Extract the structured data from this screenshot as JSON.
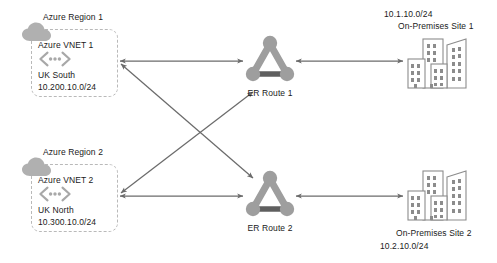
{
  "diagram": {
    "colors": {
      "arrow": "#6b6b6b",
      "node_fill": "#9e9e9e",
      "node_dark": "#5a5a5a",
      "cloud": "#b0b0b0",
      "box_border": "#b9b9b9",
      "text": "#1a1a1a",
      "building_stroke": "#8c8c8c"
    },
    "regions": [
      {
        "id": "region-1",
        "title": "Azure Region 1",
        "vnet_name": "Azure VNET 1",
        "vnet_icon": "vnet-icon",
        "cloud_icon": "cloud-icon",
        "location": "UK South",
        "cidr": "10.200.10.0/24"
      },
      {
        "id": "region-2",
        "title": "Azure Region 2",
        "vnet_name": "Azure VNET 2",
        "vnet_icon": "vnet-icon",
        "cloud_icon": "cloud-icon",
        "location": "UK North",
        "cidr": "10.300.10.0/24"
      }
    ],
    "routes": [
      {
        "id": "er-route-1",
        "label": "ER Route 1",
        "icon": "expressroute-icon"
      },
      {
        "id": "er-route-2",
        "label": "ER Route 2",
        "icon": "expressroute-icon"
      }
    ],
    "sites": [
      {
        "id": "site-1",
        "name": "On-Premises Site 1",
        "cidr": "10.1.10.0/24",
        "icon": "buildings-icon",
        "label_position": "above"
      },
      {
        "id": "site-2",
        "name": "On-Premises Site 2",
        "cidr": "10.2.10.0/24",
        "icon": "buildings-icon",
        "label_position": "below"
      }
    ],
    "connections": [
      {
        "id": "vnet1-er1",
        "from": "Azure VNET 1",
        "to": "ER Route 1",
        "style": "double-arrow"
      },
      {
        "id": "vnet1-er2",
        "from": "Azure VNET 1",
        "to": "ER Route 2",
        "style": "double-arrow"
      },
      {
        "id": "vnet2-er1",
        "from": "Azure VNET 2",
        "to": "ER Route 1",
        "style": "double-arrow"
      },
      {
        "id": "vnet2-er2",
        "from": "Azure VNET 2",
        "to": "ER Route 2",
        "style": "double-arrow"
      },
      {
        "id": "er1-site1",
        "from": "ER Route 1",
        "to": "On-Premises Site 1",
        "style": "double-arrow"
      },
      {
        "id": "er2-site2",
        "from": "ER Route 2",
        "to": "On-Premises Site 2",
        "style": "double-arrow"
      }
    ]
  }
}
